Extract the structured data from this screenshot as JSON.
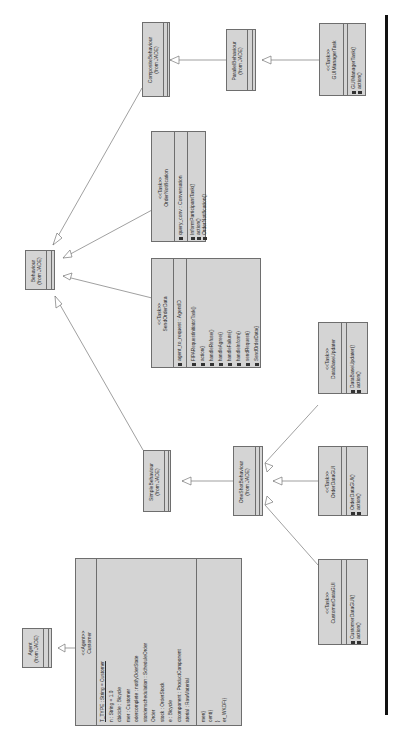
{
  "diagram": {
    "type": "UML class diagram (rotated 90°)",
    "classes": {
      "behaviour": {
        "name": "Behaviour",
        "origin": "(from JADE)"
      },
      "composite": {
        "name": "CompositeBehaviour",
        "origin": "(from JADE)"
      },
      "parallel": {
        "name": "ParallelBehaviour",
        "origin": "(from JADE)"
      },
      "simple": {
        "name": "SimpleBehaviour",
        "origin": "(from JADE)"
      },
      "oneshot": {
        "name": "OneShotBehaviour",
        "origin": "(from JADE)"
      },
      "agent": {
        "name": "Agent",
        "origin": "(from JADE)"
      },
      "gui_manager": {
        "stereotype": "<<Task>>",
        "name": "GUIManagerTask",
        "operations": [
          "GUIManagerTask()",
          "action()"
        ]
      },
      "order_notification": {
        "stereotype": "<<Task>>",
        "name": "OrderNotification",
        "attributes": [
          "query_conv : Conversation"
        ],
        "operations": [
          "InformParticipantTask()",
          "action()",
          "OrderNotification()"
        ]
      },
      "send_order_data": {
        "stereotype": "<<Task>>",
        "name": "SendOrderData",
        "attributes": [
          "agent_to_request : AgentID"
        ],
        "operations": [
          "FIPARequestInitiatorTask()",
          "action()",
          "handleRefuse()",
          "handleAgree()",
          "handleFailure()",
          "handleInform()",
          "sendRequest()",
          "SendOrderData()"
        ]
      },
      "database_updater": {
        "stereotype": "<<Task>>",
        "name": "DataBaseUpdater",
        "operations": [
          "DataBaseUpdater()",
          "action()"
        ]
      },
      "order_data_gui": {
        "stereotype": "<<Task>>",
        "name": "OrderDataGUI",
        "operations": [
          "OrderDataGUI()",
          "action()"
        ]
      },
      "customer_data_gui": {
        "stereotype": "<<Task>>",
        "name": "CustomerDataGUI",
        "operations": [
          "CustomerDataGUI()",
          "action()"
        ]
      },
      "customer": {
        "stereotype": "<<Agent>>",
        "name": "Customer",
        "attributes": [
          "T_TYPE : String = Customer",
          "n : String = 1.0",
          "cbicicle : Bicycle",
          "mer : Customer",
          "odercomplete : notifyOderState",
          "stordenschedulation : ScheduleOrder",
          "Order",
          "stock : OrderStock",
          "e : Bicycle",
          "ctcomponent : ProductComponent",
          "aterial : RawMaterial"
        ],
        "operations": [
          "mer()",
          "cent()",
          "}",
          "er_WKDF()"
        ]
      }
    }
  }
}
